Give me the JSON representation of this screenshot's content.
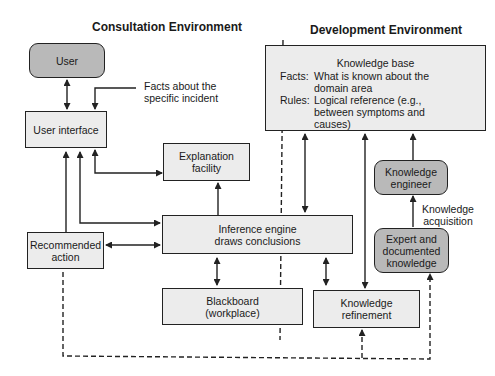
{
  "headings": {
    "consultation": "Consultation Environment",
    "development": "Development Environment"
  },
  "nodes": {
    "user": "User",
    "user_interface": "User interface",
    "explanation_facility_line1": "Explanation",
    "explanation_facility_line2": "facility",
    "inference_engine_line1": "Inference engine",
    "inference_engine_line2": "draws conclusions",
    "recommended_action_line1": "Recommended",
    "recommended_action_line2": "action",
    "blackboard_line1": "Blackboard",
    "blackboard_line2": "(workplace)",
    "knowledge_refinement_line1": "Knowledge",
    "knowledge_refinement_line2": "refinement",
    "knowledge_engineer_line1": "Knowledge",
    "knowledge_engineer_line2": "engineer",
    "expert_line1": "Expert and",
    "expert_line2": "documented",
    "expert_line3": "knowledge"
  },
  "knowledge_base": {
    "title": "Knowledge base",
    "facts_key": "Facts:",
    "facts_line1": "What is known about the",
    "facts_line2": "domain area",
    "rules_key": "Rules:",
    "rules_line1": "Logical reference (e.g.,",
    "rules_line2": "between symptoms and",
    "rules_line3": "causes)"
  },
  "annotations": {
    "facts_incident_line1": "Facts about the",
    "facts_incident_line2": "specific incident",
    "knowledge_acquisition_line1": "Knowledge",
    "knowledge_acquisition_line2": "acquisition"
  },
  "colors": {
    "box_fill": "#ececec",
    "rounded_fill": "#b9b9b9",
    "stroke": "#222222"
  }
}
